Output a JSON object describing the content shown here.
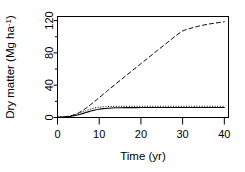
{
  "chart_data": {
    "type": "line",
    "title": "",
    "xlabel": "Time (yr)",
    "ylabel": "Dry matter (Mg ha-1)",
    "ylabel_main": "Dry matter (Mg ha",
    "ylabel_sup": "-1",
    "ylabel_tail": ")",
    "xlim": [
      0,
      41
    ],
    "ylim": [
      0,
      125
    ],
    "xticks": [
      0,
      10,
      20,
      30,
      40
    ],
    "xtick_labels": [
      "0",
      "10",
      "20",
      "30",
      "40"
    ],
    "xminor_ticks": [
      5,
      15,
      25,
      35
    ],
    "yticks": [
      0,
      40,
      80,
      120
    ],
    "ytick_labels": [
      "0",
      "40",
      "80",
      "120"
    ],
    "yminor_ticks": [
      20,
      60,
      100
    ],
    "grid": false,
    "legend": "none",
    "box": true,
    "series": [
      {
        "name": "cumulative-input",
        "style": "dashed",
        "color": "#000000",
        "x": [
          0,
          1,
          2,
          3,
          4,
          5,
          6,
          7,
          8,
          9,
          10,
          12,
          14,
          16,
          18,
          20,
          22,
          24,
          26,
          28,
          30,
          32,
          34,
          36,
          38,
          40
        ],
        "y": [
          0.0,
          0.3,
          0.9,
          1.9,
          3.4,
          5.6,
          8.6,
          12.2,
          16.2,
          20.4,
          24.6,
          33.2,
          41.6,
          50.0,
          58.3,
          66.6,
          74.9,
          83.2,
          91.4,
          99.6,
          107.0,
          110.5,
          113.2,
          115.4,
          117.0,
          118.5
        ]
      },
      {
        "name": "soil-organic-matter",
        "style": "solid",
        "color": "#000000",
        "x": [
          0,
          1,
          2,
          3,
          4,
          5,
          6,
          7,
          8,
          9,
          10,
          11,
          12,
          13,
          14,
          15,
          16,
          18,
          20,
          22,
          24,
          26,
          28,
          30,
          32,
          34,
          36,
          38,
          40
        ],
        "y": [
          0.4,
          0.5,
          0.8,
          1.3,
          2.1,
          3.3,
          4.8,
          6.4,
          8.0,
          9.3,
          10.3,
          11.0,
          11.5,
          11.8,
          12.0,
          12.1,
          12.2,
          12.25,
          12.3,
          12.3,
          12.3,
          12.3,
          12.3,
          12.3,
          12.3,
          12.3,
          12.3,
          12.3,
          12.3
        ]
      },
      {
        "name": "plant-residue",
        "style": "dotted",
        "color": "#000000",
        "x": [
          0,
          1,
          2,
          3,
          4,
          5,
          6,
          7,
          8,
          9,
          10,
          11,
          12,
          13,
          14,
          15,
          16,
          18,
          20,
          22,
          24,
          26,
          28,
          30,
          32,
          34,
          36,
          38,
          40
        ],
        "y": [
          0.4,
          0.6,
          1.1,
          1.9,
          3.1,
          4.8,
          6.8,
          8.8,
          10.6,
          11.9,
          12.7,
          13.2,
          13.5,
          13.7,
          13.8,
          13.85,
          13.9,
          13.9,
          13.9,
          13.9,
          13.9,
          13.9,
          13.9,
          13.9,
          13.9,
          13.9,
          13.9,
          13.9,
          13.9
        ]
      }
    ]
  },
  "figure": {
    "background": "#ffffff",
    "foreground": "#000000"
  }
}
